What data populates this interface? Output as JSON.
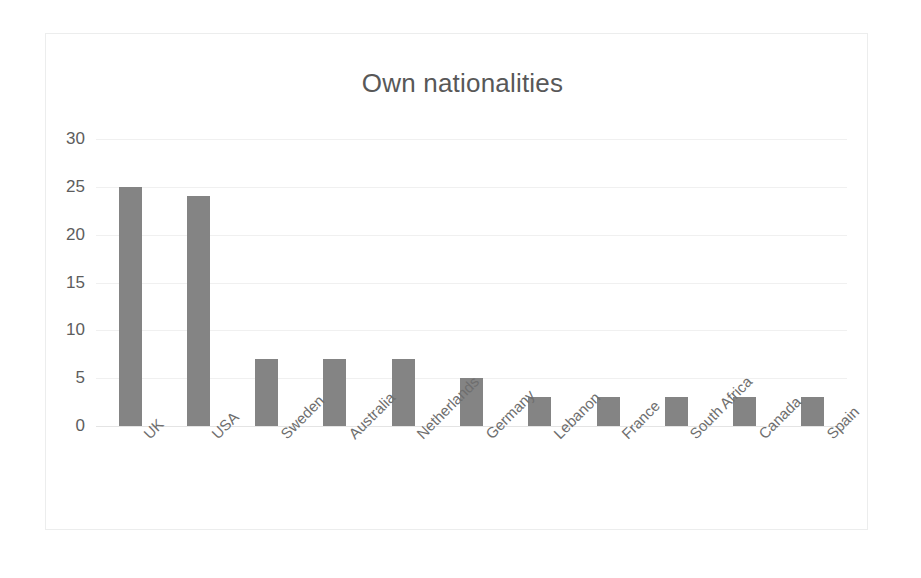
{
  "chart_data": {
    "type": "bar",
    "title": "Own nationalities",
    "xlabel": "",
    "ylabel": "",
    "ylim": [
      0,
      30
    ],
    "ytick_step": 5,
    "yticks": [
      0,
      5,
      10,
      15,
      20,
      25,
      30
    ],
    "ytick_labels": [
      "0",
      "5",
      "10",
      "15",
      "20",
      "25",
      "30"
    ],
    "grid": true,
    "legend": false,
    "legend_position": "none",
    "xtick_rotation": -45,
    "categories": [
      "UK",
      "USA",
      "Sweden",
      "Australia",
      "Netherlands",
      "Germany",
      "Lebanon",
      "France",
      "South Africa",
      "Canada",
      "Spain"
    ],
    "values": [
      25,
      24,
      7,
      7,
      7,
      5,
      3,
      3,
      3,
      3,
      3
    ],
    "series": [
      {
        "name": "Own nationalities",
        "values": [
          25,
          24,
          7,
          7,
          7,
          5,
          3,
          3,
          3,
          3,
          3
        ]
      }
    ],
    "colors": {
      "bar": "#848484",
      "gridline": "#f0f0f0",
      "axis": "#e4e4e4",
      "title_text": "#585858",
      "tick_text": "#5d5d5d",
      "category_text": "#6e6e6e",
      "frame_border": "#eceded",
      "background": "#ffffff"
    }
  }
}
